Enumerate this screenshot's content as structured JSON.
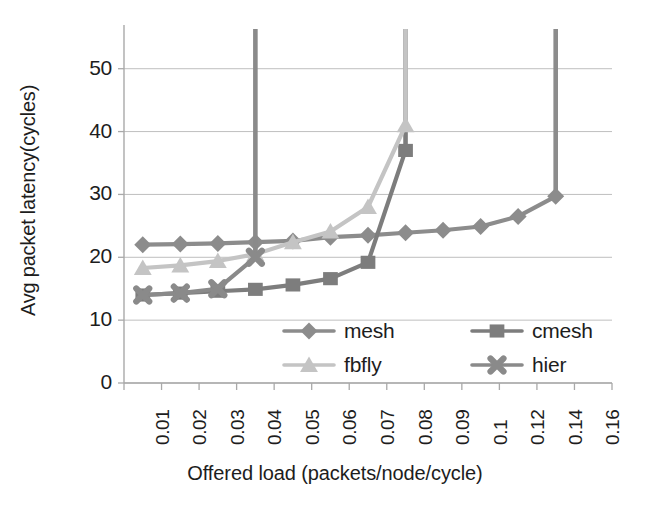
{
  "chart_data": {
    "type": "line",
    "title": "",
    "xlabel": "Offered load (packets/node/cycle)",
    "ylabel": "Avg packet latency(cycles)",
    "categories": [
      "0.01",
      "0.02",
      "0.03",
      "0.04",
      "0.05",
      "0.06",
      "0.07",
      "0.08",
      "0.09",
      "0.1",
      "0.12",
      "0.14",
      "0.16"
    ],
    "x_tick_labels": [
      "0.01",
      "0.02",
      "0.03",
      "0.04",
      "0.05",
      "0.06",
      "0.07",
      "0.08",
      "0.09",
      "0.1",
      "0.12",
      "0.14",
      "0.16"
    ],
    "y_tick_labels": [
      "0",
      "10",
      "20",
      "30",
      "40",
      "50"
    ],
    "y_ticks": [
      0,
      10,
      20,
      30,
      40,
      50
    ],
    "ylim": [
      0,
      56
    ],
    "grid": "horizontal",
    "legend_position": "inside-bottom-center",
    "series": [
      {
        "name": "mesh",
        "marker": "diamond",
        "color": "#8c8c8c",
        "values": [
          22.0,
          22.1,
          22.2,
          22.4,
          22.6,
          23.2,
          23.5,
          23.9,
          24.3,
          24.9,
          26.5,
          29.7,
          null
        ],
        "overflow_at": "0.14",
        "overflow_note": "saturates and rises off-scale above 0.14"
      },
      {
        "name": "cmesh",
        "marker": "square",
        "color": "#7d7d7d",
        "values": [
          14.0,
          14.3,
          14.6,
          14.9,
          15.6,
          16.6,
          19.2,
          37.0,
          null,
          null,
          null,
          null,
          null
        ],
        "overflow_at": "0.08",
        "overflow_note": "saturates after 0.08"
      },
      {
        "name": "fbfly",
        "marker": "triangle",
        "color": "#c4c4c4",
        "values": [
          18.3,
          18.7,
          19.4,
          20.5,
          22.4,
          24.1,
          28.0,
          41.0,
          null,
          null,
          null,
          null,
          null
        ],
        "overflow_at": "0.08",
        "overflow_note": "saturates and rises off-scale at 0.08"
      },
      {
        "name": "hier",
        "marker": "x",
        "color": "#8a8a8a",
        "values": [
          14.0,
          14.3,
          15.0,
          20.0,
          null,
          null,
          null,
          null,
          null,
          null,
          null,
          null,
          null
        ],
        "overflow_at": "0.04",
        "overflow_note": "saturates and rises off-scale at 0.04"
      }
    ],
    "legend": [
      {
        "label": "mesh",
        "marker": "diamond",
        "color": "#8c8c8c"
      },
      {
        "label": "cmesh",
        "marker": "square",
        "color": "#7d7d7d"
      },
      {
        "label": "fbfly",
        "marker": "triangle",
        "color": "#c4c4c4"
      },
      {
        "label": "hier",
        "marker": "x",
        "color": "#8a8a8a"
      }
    ],
    "colors": {
      "axis": "#a9a9a9",
      "grid": "#bfbfbf",
      "text": "#1d1d1d",
      "background": "#ffffff"
    }
  }
}
